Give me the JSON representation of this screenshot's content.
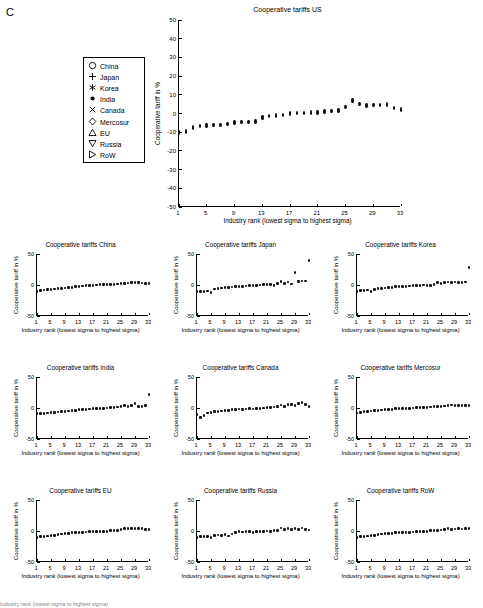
{
  "panel": {
    "label": "C"
  },
  "legend": {
    "name": "country-legend",
    "items": [
      {
        "label": "China",
        "marker": "circle-open-icon"
      },
      {
        "label": "Japan",
        "marker": "plus-icon"
      },
      {
        "label": "Korea",
        "marker": "asterisk-icon"
      },
      {
        "label": "India",
        "marker": "dot-filled-icon"
      },
      {
        "label": "Canada",
        "marker": "cross-x-icon"
      },
      {
        "label": "Mercosur",
        "marker": "diamond-open-icon"
      },
      {
        "label": "EU",
        "marker": "triangle-up-icon"
      },
      {
        "label": "Russia",
        "marker": "triangle-down-icon"
      },
      {
        "label": "RoW",
        "marker": "triangle-right-icon"
      }
    ]
  },
  "axis_labels": {
    "x": "Industry rank (lowest sigma to highest sigma)",
    "y": "Cooperative tariff in %"
  },
  "caption": "Industry rank (lowest sigma to highest sigma)",
  "chart_data": [
    {
      "id": "us",
      "type": "scatter",
      "title": "Cooperative tariffs US",
      "xlabel": "Industry rank (lowest sigma to highest sigma)",
      "ylabel": "Cooperative tariff in %",
      "xlim": [
        1,
        33
      ],
      "ylim": [
        -50,
        50
      ],
      "yticks": [
        -50,
        -40,
        -30,
        -20,
        -10,
        0,
        10,
        20,
        30,
        40,
        50
      ],
      "xticks": [
        1,
        5,
        9,
        13,
        17,
        21,
        25,
        29,
        33
      ],
      "grid": false,
      "legend_position": "outside-left",
      "x": [
        1,
        2,
        3,
        4,
        5,
        6,
        7,
        8,
        9,
        10,
        11,
        12,
        13,
        14,
        15,
        16,
        17,
        18,
        19,
        20,
        21,
        22,
        23,
        24,
        25,
        26,
        27,
        28,
        29,
        30,
        31,
        32,
        33
      ],
      "values": [
        -10.2,
        -9.6,
        -7.4,
        -6.6,
        -6.4,
        -6.3,
        -6.2,
        -5.6,
        -4.9,
        -4.6,
        -4.4,
        -4.3,
        -2.2,
        -1.4,
        -1.1,
        -0.8,
        0.1,
        0.2,
        0.4,
        0.5,
        0.6,
        1.1,
        1.2,
        1.6,
        3.5,
        7.0,
        5.0,
        4.2,
        4.4,
        4.6,
        4.9,
        3.0,
        2.1
      ]
    },
    {
      "id": "china",
      "type": "scatter",
      "title": "Cooperative tariffs China",
      "xlabel": "Industry rank (lowest sigma to highest sigma)",
      "ylabel": "Cooperative tariff in %",
      "xlim": [
        1,
        33
      ],
      "ylim": [
        -50,
        50
      ],
      "yticks": [
        -50,
        0,
        50
      ],
      "xticks": [
        1,
        5,
        9,
        13,
        17,
        21,
        25,
        29,
        33
      ],
      "x": [
        1,
        2,
        3,
        4,
        5,
        6,
        7,
        8,
        9,
        10,
        11,
        12,
        13,
        14,
        15,
        16,
        17,
        18,
        19,
        20,
        21,
        22,
        23,
        24,
        25,
        26,
        27,
        28,
        29,
        30,
        31,
        32,
        33
      ],
      "values": [
        -10.5,
        -9.0,
        -8.0,
        -7.5,
        -7.2,
        -6.5,
        -6.0,
        -5.4,
        -4.8,
        -4.2,
        -3.6,
        -3.0,
        -2.0,
        -1.6,
        -1.2,
        -0.8,
        -0.4,
        0.0,
        0.3,
        0.5,
        0.8,
        1.0,
        1.3,
        1.6,
        2.0,
        2.6,
        3.2,
        3.6,
        3.8,
        3.6,
        3.2,
        2.6,
        2.0
      ]
    },
    {
      "id": "japan",
      "type": "scatter",
      "title": "Cooperative tariffs Japan",
      "xlabel": "Industry rank (lowest sigma to highest sigma)",
      "ylabel": "Cooperative tariff in %",
      "xlim": [
        1,
        33
      ],
      "ylim": [
        -50,
        50
      ],
      "yticks": [
        -50,
        0,
        50
      ],
      "xticks": [
        1,
        5,
        9,
        13,
        17,
        21,
        25,
        29,
        33
      ],
      "x": [
        1,
        2,
        3,
        4,
        5,
        6,
        7,
        8,
        9,
        10,
        11,
        12,
        13,
        14,
        15,
        16,
        17,
        18,
        19,
        20,
        21,
        22,
        23,
        24,
        25,
        26,
        27,
        28,
        29,
        30,
        31,
        32,
        33
      ],
      "values": [
        -11.0,
        -10.5,
        -10.0,
        -9.8,
        -12.0,
        -6.5,
        -5.8,
        -5.0,
        -4.5,
        -4.0,
        -3.2,
        -2.4,
        -2.0,
        -2.2,
        -1.6,
        -1.2,
        -0.8,
        -0.4,
        0.0,
        0.4,
        0.8,
        1.2,
        -1.0,
        2.0,
        6.0,
        3.0,
        5.0,
        1.5,
        20.0,
        6.0,
        6.5,
        6.5,
        40.0
      ]
    },
    {
      "id": "korea",
      "type": "scatter",
      "title": "Cooperative tariffs Korea",
      "xlabel": "Industry rank (lowest sigma to highest sigma)",
      "ylabel": "Cooperative tariff in %",
      "xlim": [
        1,
        33
      ],
      "ylim": [
        -50,
        50
      ],
      "yticks": [
        -50,
        0,
        50
      ],
      "xticks": [
        1,
        5,
        9,
        13,
        17,
        21,
        25,
        29,
        33
      ],
      "x": [
        1,
        2,
        3,
        4,
        5,
        6,
        7,
        8,
        9,
        10,
        11,
        12,
        13,
        14,
        15,
        16,
        17,
        18,
        19,
        20,
        21,
        22,
        23,
        24,
        25,
        26,
        27,
        28,
        29,
        30,
        31,
        32,
        33
      ],
      "values": [
        -11.0,
        -9.0,
        -8.5,
        -8.0,
        -11.0,
        -7.0,
        -6.0,
        -5.5,
        -5.0,
        -4.5,
        -4.0,
        -3.0,
        -2.5,
        -3.0,
        -2.0,
        -1.5,
        -1.0,
        -1.2,
        -0.5,
        0.0,
        -0.5,
        -1.0,
        0.5,
        4.0,
        3.0,
        4.5,
        5.0,
        4.0,
        5.0,
        4.0,
        4.5,
        5.0,
        28.0
      ]
    },
    {
      "id": "india",
      "type": "scatter",
      "title": "Cooperative tariffs India",
      "xlabel": "Industry rank (lowest sigma to highest sigma)",
      "ylabel": "Cooperative tariff in %",
      "xlim": [
        1,
        33
      ],
      "ylim": [
        -50,
        50
      ],
      "yticks": [
        -50,
        0,
        50
      ],
      "xticks": [
        1,
        5,
        9,
        13,
        17,
        21,
        25,
        29,
        33
      ],
      "x": [
        1,
        2,
        3,
        4,
        5,
        6,
        7,
        8,
        9,
        10,
        11,
        12,
        13,
        14,
        15,
        16,
        17,
        18,
        19,
        20,
        21,
        22,
        23,
        24,
        25,
        26,
        27,
        28,
        29,
        30,
        31,
        32,
        33
      ],
      "values": [
        -9.5,
        -9.0,
        -8.5,
        -8.0,
        -7.5,
        -7.0,
        -6.5,
        -6.0,
        -5.5,
        -5.0,
        -4.0,
        -3.5,
        -3.0,
        -2.5,
        -2.0,
        -1.5,
        -1.0,
        -1.2,
        -0.8,
        -0.5,
        0.0,
        0.5,
        1.0,
        1.5,
        2.0,
        4.0,
        3.0,
        4.5,
        7.0,
        3.0,
        2.5,
        4.0,
        22.0
      ]
    },
    {
      "id": "canada",
      "type": "scatter",
      "title": "Cooperative tariffs Canada",
      "xlabel": "Industry rank (lowest sigma to highest sigma)",
      "ylabel": "Cooperative tariff in %",
      "xlim": [
        1,
        33
      ],
      "ylim": [
        -50,
        50
      ],
      "yticks": [
        -50,
        0,
        50
      ],
      "xticks": [
        1,
        5,
        9,
        13,
        17,
        21,
        25,
        29,
        33
      ],
      "x": [
        1,
        2,
        3,
        4,
        5,
        6,
        7,
        8,
        9,
        10,
        11,
        12,
        13,
        14,
        15,
        16,
        17,
        18,
        19,
        20,
        21,
        22,
        23,
        24,
        25,
        26,
        27,
        28,
        29,
        30,
        31,
        32,
        33
      ],
      "values": [
        -11.0,
        -15.0,
        -12.0,
        -8.0,
        -7.0,
        -6.0,
        -5.5,
        -5.0,
        -4.5,
        -4.0,
        -3.0,
        -2.5,
        -1.5,
        -2.0,
        -1.5,
        -1.0,
        -1.5,
        -1.0,
        -0.5,
        0.0,
        0.5,
        1.0,
        1.5,
        2.0,
        5.0,
        3.0,
        5.5,
        6.0,
        4.5,
        7.0,
        9.0,
        6.0,
        2.0
      ]
    },
    {
      "id": "mercosur",
      "type": "scatter",
      "title": "Cooperative tariffs Mercosur",
      "xlabel": "Industry rank (lowest sigma to highest sigma)",
      "ylabel": "Cooperative tariff in %",
      "xlim": [
        1,
        33
      ],
      "ylim": [
        -50,
        50
      ],
      "yticks": [
        -50,
        0,
        50
      ],
      "xticks": [
        1,
        5,
        9,
        13,
        17,
        21,
        25,
        29,
        33
      ],
      "x": [
        1,
        2,
        3,
        4,
        5,
        6,
        7,
        8,
        9,
        10,
        11,
        12,
        13,
        14,
        15,
        16,
        17,
        18,
        19,
        20,
        21,
        22,
        23,
        24,
        25,
        26,
        27,
        28,
        29,
        30,
        31,
        32,
        33
      ],
      "values": [
        -8.0,
        -7.0,
        -6.0,
        -5.5,
        -5.0,
        -4.5,
        -4.0,
        -3.2,
        -2.6,
        -2.2,
        -1.8,
        -1.4,
        -1.0,
        -0.6,
        -0.4,
        -0.2,
        0.0,
        0.3,
        0.6,
        0.9,
        1.2,
        1.5,
        1.8,
        2.2,
        2.6,
        3.2,
        4.2,
        4.8,
        4.6,
        4.4,
        4.2,
        4.0,
        3.6
      ]
    },
    {
      "id": "eu",
      "type": "scatter",
      "title": "Cooperative tariffs EU",
      "xlabel": "Industry rank (lowest sigma to highest sigma)",
      "ylabel": "Cooperative tariff in %",
      "xlim": [
        1,
        33
      ],
      "ylim": [
        -50,
        50
      ],
      "yticks": [
        -50,
        0,
        50
      ],
      "xticks": [
        1,
        5,
        9,
        13,
        17,
        21,
        25,
        29,
        33
      ],
      "x": [
        1,
        2,
        3,
        4,
        5,
        6,
        7,
        8,
        9,
        10,
        11,
        12,
        13,
        14,
        15,
        16,
        17,
        18,
        19,
        20,
        21,
        22,
        23,
        24,
        25,
        26,
        27,
        28,
        29,
        30,
        31,
        32,
        33
      ],
      "values": [
        -11.0,
        -9.5,
        -8.5,
        -8.0,
        -7.5,
        -7.0,
        -6.0,
        -5.0,
        -4.2,
        -3.6,
        -3.0,
        -2.4,
        -2.0,
        -1.8,
        -1.6,
        -1.4,
        -1.0,
        -1.2,
        -0.8,
        -0.6,
        -0.2,
        0.2,
        0.6,
        1.0,
        2.0,
        3.4,
        4.0,
        4.2,
        4.0,
        4.2,
        3.8,
        3.0,
        2.2
      ]
    },
    {
      "id": "russia",
      "type": "scatter",
      "title": "Cooperative tariffs Russia",
      "xlabel": "Industry rank (lowest sigma to highest sigma)",
      "ylabel": "Cooperative tariff in %",
      "xlim": [
        1,
        33
      ],
      "ylim": [
        -50,
        50
      ],
      "yticks": [
        -50,
        0,
        50
      ],
      "xticks": [
        1,
        5,
        9,
        13,
        17,
        21,
        25,
        29,
        33
      ],
      "x": [
        1,
        2,
        3,
        4,
        5,
        6,
        7,
        8,
        9,
        10,
        11,
        12,
        13,
        14,
        15,
        16,
        17,
        18,
        19,
        20,
        21,
        22,
        23,
        24,
        25,
        26,
        27,
        28,
        29,
        30,
        31,
        32,
        33
      ],
      "values": [
        -10.0,
        -9.5,
        -9.0,
        -8.5,
        -11.0,
        -7.5,
        -6.5,
        -7.5,
        -6.0,
        -8.0,
        -5.0,
        -2.5,
        -1.0,
        -1.5,
        -1.2,
        -0.8,
        -2.0,
        -1.0,
        -0.5,
        -0.2,
        0.0,
        -0.5,
        0.5,
        1.0,
        5.0,
        2.0,
        3.5,
        3.0,
        3.5,
        2.5,
        5.0,
        3.0,
        1.5
      ]
    },
    {
      "id": "row",
      "type": "scatter",
      "title": "Cooperative tariffs RoW",
      "xlabel": "Industry rank (lowest sigma to highest sigma)",
      "ylabel": "Cooperative tariff in %",
      "xlim": [
        1,
        33
      ],
      "ylim": [
        -50,
        50
      ],
      "yticks": [
        -50,
        0,
        50
      ],
      "xticks": [
        1,
        5,
        9,
        13,
        17,
        21,
        25,
        29,
        33
      ],
      "x": [
        1,
        2,
        3,
        4,
        5,
        6,
        7,
        8,
        9,
        10,
        11,
        12,
        13,
        14,
        15,
        16,
        17,
        18,
        19,
        20,
        21,
        22,
        23,
        24,
        25,
        26,
        27,
        28,
        29,
        30,
        31,
        32,
        33
      ],
      "values": [
        -10.0,
        -9.0,
        -8.5,
        -8.0,
        -7.5,
        -7.0,
        -6.0,
        -5.0,
        -4.5,
        -4.0,
        -3.5,
        -3.0,
        -2.5,
        -2.2,
        -2.0,
        -1.8,
        -1.5,
        -1.2,
        -0.8,
        -0.5,
        -0.2,
        0.2,
        0.5,
        1.0,
        1.5,
        2.5,
        3.5,
        3.0,
        3.2,
        3.4,
        3.2,
        3.4,
        3.6
      ]
    }
  ]
}
